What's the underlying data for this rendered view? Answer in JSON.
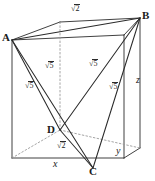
{
  "figure": {
    "type": "geometry-diagram",
    "stroke_color": "#2b2b2b",
    "hidden_line_color": "#8c8c8c",
    "background": "#ffffff"
  },
  "vertices": [
    {
      "name": "A",
      "label": "A",
      "x": 12,
      "y": 40
    },
    {
      "name": "B",
      "label": "B",
      "x": 140,
      "y": 18
    },
    {
      "name": "C",
      "label": "C",
      "x": 93,
      "y": 172
    },
    {
      "name": "D",
      "label": "D",
      "x": 54,
      "y": 130
    }
  ],
  "edge_labels": [
    {
      "name": "ab",
      "root": "√",
      "radicand": "2",
      "x": 74,
      "y": 9,
      "edge": "A-B"
    },
    {
      "name": "ac",
      "root": "√",
      "radicand": "5",
      "x": 48,
      "y": 67,
      "edge": "A-C"
    },
    {
      "name": "ad",
      "root": "√",
      "radicand": "5",
      "x": 28,
      "y": 86,
      "edge": "A-D"
    },
    {
      "name": "bd",
      "root": "√",
      "radicand": "5",
      "x": 92,
      "y": 64,
      "edge": "B-D"
    },
    {
      "name": "bc",
      "root": "√",
      "radicand": "5",
      "x": 112,
      "y": 87,
      "edge": "B-C"
    },
    {
      "name": "dc",
      "root": "√",
      "radicand": "2",
      "x": 60,
      "y": 146,
      "edge": "D-C"
    }
  ],
  "axis_labels": [
    {
      "name": "x",
      "label": "x",
      "x": 55,
      "y": 163
    },
    {
      "name": "y",
      "label": "y",
      "x": 118,
      "y": 150
    },
    {
      "name": "z",
      "label": "z",
      "x": 138,
      "y": 79
    }
  ]
}
